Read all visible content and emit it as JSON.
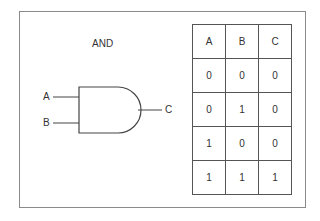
{
  "gate": {
    "title": "AND",
    "inputs": [
      "A",
      "B"
    ],
    "output": "C"
  },
  "truth_table": {
    "headers": [
      "A",
      "B",
      "C"
    ],
    "rows": [
      [
        "0",
        "0",
        "0"
      ],
      [
        "0",
        "1",
        "0"
      ],
      [
        "1",
        "0",
        "0"
      ],
      [
        "1",
        "1",
        "1"
      ]
    ]
  }
}
